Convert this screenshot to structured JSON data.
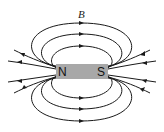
{
  "diagram": {
    "field_label": "B",
    "magnet": {
      "north_label": "N",
      "south_label": "S",
      "color": "#a8a8a8"
    },
    "line_color": "#1a1a1a"
  }
}
